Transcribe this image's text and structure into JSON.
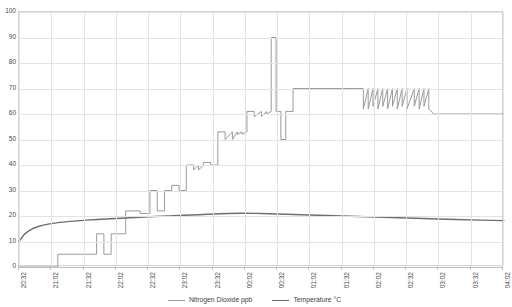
{
  "chart_data": {
    "type": "line",
    "title": "",
    "xlabel": "",
    "ylabel": "",
    "grid": true,
    "legend_position": "bottom-center",
    "ylim": [
      0,
      100
    ],
    "y_ticks": [
      0,
      10,
      20,
      30,
      40,
      50,
      60,
      70,
      80,
      90,
      100
    ],
    "x_tick_labels": [
      "20:32",
      "21:02",
      "21:32",
      "22:02",
      "22:32",
      "23:02",
      "23:32",
      "00:02",
      "00:32",
      "01:02",
      "01:32",
      "02:02",
      "02:32",
      "03:02",
      "03:32",
      "04:02"
    ],
    "x_range_start": "20:32",
    "x_range_end": "04:17",
    "series": [
      {
        "name": "Nitrogen Dioxide ppb",
        "color": "#9a9a9a",
        "unit": "ppb",
        "x": [
          0,
          8,
          8,
          16,
          16,
          17.5,
          17.5,
          19,
          19,
          22,
          22,
          25,
          25,
          27,
          27,
          28.5,
          28.5,
          30,
          30,
          31.5,
          31.5,
          33,
          33,
          34.5,
          34.5,
          36,
          36,
          37,
          37,
          38,
          38,
          39.5,
          39.5,
          41,
          41,
          42.5,
          42.5,
          44,
          44,
          45,
          45,
          46,
          46,
          47,
          47,
          48.5,
          48.5,
          50,
          50,
          51,
          51,
          52,
          52,
          53,
          53,
          54,
          54,
          55,
          55,
          56.5,
          56.5,
          58,
          58,
          59,
          59,
          60,
          60,
          61,
          61,
          62,
          62,
          63,
          63,
          64.5,
          64.5,
          66,
          66,
          67,
          67,
          68,
          68,
          69,
          69,
          70,
          70,
          71,
          71,
          72,
          72,
          73,
          73,
          74,
          74,
          75,
          75,
          76,
          76,
          77,
          77,
          78,
          78,
          79,
          79,
          80,
          80,
          81.5,
          81.5,
          82.5,
          82.5,
          83.5,
          83.5,
          84.5,
          84.5,
          85.5,
          85.5,
          100
        ],
        "values": [
          0,
          0,
          5,
          5,
          13,
          13,
          5,
          5,
          13,
          13,
          22,
          22,
          21,
          21,
          30,
          30,
          22,
          22,
          30,
          30,
          32,
          32,
          30,
          30,
          40,
          40,
          38,
          40,
          38,
          40,
          41,
          41,
          40,
          40,
          53,
          53,
          50,
          53,
          50,
          53,
          52,
          53,
          52,
          53,
          61,
          61,
          59,
          61,
          59,
          61,
          60,
          61,
          90,
          90,
          61,
          61,
          50,
          50,
          61,
          61,
          70,
          70,
          70,
          70,
          70,
          70,
          70,
          70,
          70,
          70,
          70,
          70,
          70,
          70,
          70,
          70,
          70,
          70,
          70,
          70,
          70,
          70,
          70,
          70,
          70,
          70,
          62,
          70,
          62,
          70,
          63,
          70,
          62,
          70,
          63,
          70,
          62,
          70,
          63,
          70,
          62,
          70,
          63,
          70,
          62,
          70,
          63,
          70,
          62,
          70,
          63,
          70,
          62,
          60,
          60,
          60
        ]
      },
      {
        "name": "Temperature °C",
        "color": "#6e6e6e",
        "unit": "°C",
        "x": [
          0,
          1,
          2,
          3,
          4,
          5,
          6,
          7,
          8,
          9,
          10,
          12,
          14,
          16,
          18,
          20,
          22,
          25,
          28,
          31,
          34,
          37,
          40,
          43,
          46,
          50,
          55,
          60,
          65,
          70,
          75,
          80,
          85,
          90,
          95,
          100
        ],
        "values": [
          10,
          12.6,
          14.2,
          15.2,
          15.9,
          16.4,
          16.8,
          17.1,
          17.4,
          17.6,
          17.8,
          18.1,
          18.4,
          18.6,
          18.8,
          19.0,
          19.2,
          19.5,
          19.8,
          20.0,
          20.3,
          20.5,
          20.8,
          21.0,
          21.1,
          21.0,
          20.7,
          20.4,
          20.1,
          19.8,
          19.5,
          19.2,
          18.9,
          18.6,
          18.4,
          18.2
        ]
      }
    ]
  },
  "legend": {
    "items": [
      {
        "label": "Nitrogen Dioxide ppb",
        "swatch_class": "no2"
      },
      {
        "label": "Temperature °C",
        "swatch_class": "temp"
      }
    ]
  }
}
